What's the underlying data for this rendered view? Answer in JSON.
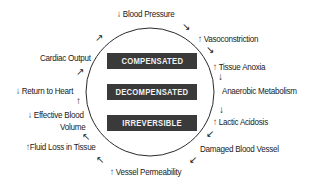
{
  "stages": [
    "COMPENSATED",
    "DECOMPENSATED",
    "IRREVERSIBLE"
  ],
  "cycle": [
    {
      "prefix": "↓",
      "text": "Blood Pressure"
    },
    {
      "prefix": "↑",
      "text": "Vasoconstriction"
    },
    {
      "prefix": "↑",
      "text": "Tissue Anoxia"
    },
    {
      "prefix": "",
      "text": "Anaerobic Metabolism"
    },
    {
      "prefix": "↑",
      "text": "Lactic Acidosis"
    },
    {
      "prefix": "",
      "text": "Damaged Blood Vessel"
    },
    {
      "prefix": "↑",
      "text": "Vessel Permeability"
    },
    {
      "prefix": "↑",
      "text": "Fluid Loss in Tissue"
    },
    {
      "prefix": "↓",
      "text": "Effective Blood"
    },
    {
      "prefix": "",
      "text": "Volume"
    },
    {
      "prefix": "↓",
      "text": "Return to Heart"
    },
    {
      "prefix": "",
      "text": "Cardiac Output"
    }
  ],
  "arrows": {
    "down_right": "↘",
    "down": "↓",
    "down_left": "↙",
    "up_left": "↖",
    "up": "↑",
    "up_right": "↗"
  }
}
